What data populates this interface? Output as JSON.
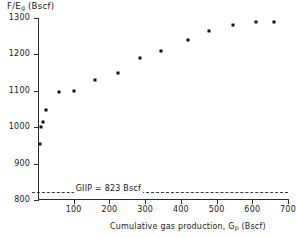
{
  "chart_data": {
    "type": "scatter",
    "title": "",
    "xlabel": "Cumulative gas production, Gp (Bscf)",
    "xlabel_main": "Cumulative gas production, G",
    "xlabel_sub": "p",
    "xlabel_tail": " (Bscf)",
    "ylabel": "F/Eg (Bscf)",
    "ylabel_main": "F/E",
    "ylabel_sub": "g",
    "ylabel_tail": " (Bscf)",
    "xlim": [
      0,
      700
    ],
    "ylim": [
      800,
      1300
    ],
    "xticks": [
      0,
      100,
      200,
      300,
      400,
      500,
      600,
      700
    ],
    "xtick_labels": [
      "",
      "100",
      "200",
      "300",
      "400",
      "500",
      "600",
      "700"
    ],
    "yticks": [
      800,
      900,
      1000,
      1100,
      1200,
      1300
    ],
    "ytick_labels": [
      "800",
      "900",
      "1000",
      "1100",
      "1200",
      "1300"
    ],
    "grid": false,
    "legend": "none",
    "marker": "square",
    "marker_color": "#111111",
    "axis_color": "#2b2b2b",
    "x": [
      5,
      9,
      13,
      22,
      60,
      100,
      160,
      225,
      285,
      345,
      420,
      480,
      545,
      610,
      660
    ],
    "y": [
      955,
      1000,
      1015,
      1048,
      1098,
      1100,
      1130,
      1150,
      1190,
      1210,
      1240,
      1265,
      1280,
      1290,
      1288
    ],
    "points": [
      {
        "x": 5,
        "y": 955
      },
      {
        "x": 9,
        "y": 1000
      },
      {
        "x": 13,
        "y": 1015
      },
      {
        "x": 22,
        "y": 1048
      },
      {
        "x": 60,
        "y": 1098
      },
      {
        "x": 100,
        "y": 1100
      },
      {
        "x": 160,
        "y": 1130
      },
      {
        "x": 225,
        "y": 1150
      },
      {
        "x": 285,
        "y": 1190
      },
      {
        "x": 345,
        "y": 1210
      },
      {
        "x": 420,
        "y": 1240
      },
      {
        "x": 480,
        "y": 1265
      },
      {
        "x": 545,
        "y": 1280
      },
      {
        "x": 610,
        "y": 1290
      },
      {
        "x": 660,
        "y": 1288
      }
    ],
    "annotations": [
      {
        "name": "giip-reference-line",
        "label": "GIIP = 823 Bscf",
        "value": 823,
        "units": "Bscf",
        "style": "dashed-horizontal",
        "label_x": 100
      }
    ]
  }
}
